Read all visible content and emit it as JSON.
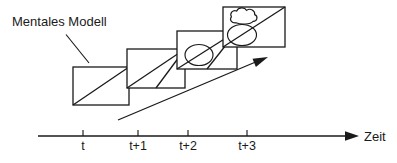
{
  "diagram": {
    "annotation": {
      "text": "Mentales Modell",
      "leader_icon": "leader-line-icon"
    },
    "growth_arrow": {
      "icon": "diagonal-arrow-icon"
    },
    "frames": [
      {
        "time": "t",
        "contents": [
          "diagonal-line-icon"
        ]
      },
      {
        "time": "t+1",
        "contents": [
          "diagonal-line-icon",
          "triangle-line-icon"
        ]
      },
      {
        "time": "t+2",
        "contents": [
          "diagonal-line-icon",
          "triangle-line-icon",
          "ellipse-icon"
        ]
      },
      {
        "time": "t+3",
        "contents": [
          "diagonal-line-icon",
          "ellipse-icon",
          "cloud-icon"
        ]
      }
    ]
  },
  "axis": {
    "label": "Zeit",
    "arrow_icon": "axis-arrow-icon",
    "ticks": [
      {
        "label": "t"
      },
      {
        "label": "t+1"
      },
      {
        "label": "t+2"
      },
      {
        "label": "t+3"
      }
    ]
  },
  "colors": {
    "ink": "#1a1a1a",
    "paper": "#ffffff"
  }
}
